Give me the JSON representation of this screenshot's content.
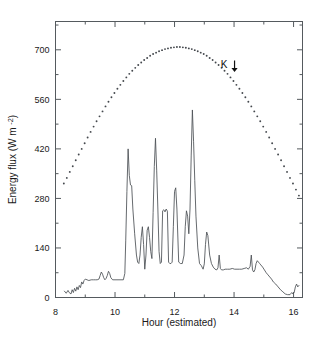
{
  "chart_data": {
    "type": "line",
    "title": "",
    "xlabel": "Hour  (estimated)",
    "ylabel": "Energy flux  (W m⁻²)",
    "xlim": [
      8,
      16.3
    ],
    "ylim": [
      0,
      780
    ],
    "grid": false,
    "legend_position": "none",
    "xticks": [
      8,
      10,
      12,
      14,
      16
    ],
    "xtick_labels": [
      "8",
      "10",
      "12",
      "14",
      "16"
    ],
    "xminor_ticks": [
      9,
      11,
      13,
      15
    ],
    "yticks": [
      0,
      140,
      280,
      420,
      560,
      700
    ],
    "ytick_labels": [
      "0",
      "140",
      "280",
      "420",
      "560",
      "700"
    ],
    "yminor_ticks": [
      70,
      210,
      350,
      490,
      630,
      770
    ],
    "annotations": [
      {
        "name": "k-arrow-annotation",
        "text": "K",
        "x": 14.0,
        "y": 650,
        "marker": "down-arrow"
      }
    ],
    "series": [
      {
        "name": "Clear-sky global solar radiation (K)",
        "style": "dotted",
        "marker": "dot",
        "x": [
          8.28,
          8.38,
          8.48,
          8.58,
          8.68,
          8.78,
          8.88,
          8.98,
          9.08,
          9.18,
          9.28,
          9.38,
          9.48,
          9.58,
          9.68,
          9.78,
          9.88,
          9.98,
          10.08,
          10.18,
          10.28,
          10.38,
          10.48,
          10.58,
          10.68,
          10.78,
          10.88,
          10.98,
          11.08,
          11.18,
          11.28,
          11.38,
          11.48,
          11.58,
          11.68,
          11.78,
          11.88,
          11.98,
          12.08,
          12.18,
          12.28,
          12.38,
          12.48,
          12.58,
          12.68,
          12.78,
          12.88,
          12.98,
          13.08,
          13.18,
          13.28,
          13.38,
          13.48,
          13.58,
          13.68,
          13.78,
          13.88,
          13.98,
          14.08,
          14.18,
          14.28,
          14.38,
          14.48,
          14.58,
          14.68,
          14.78,
          14.88,
          14.98,
          15.08,
          15.18,
          15.28,
          15.38,
          15.48,
          15.58,
          15.68,
          15.78,
          15.88,
          15.98,
          16.08,
          16.18
        ],
        "y": [
          322,
          338,
          355,
          371,
          388,
          404,
          420,
          436,
          452,
          468,
          483,
          498,
          512,
          526,
          540,
          553,
          566,
          578,
          590,
          601,
          612,
          622,
          632,
          641,
          649,
          657,
          664,
          671,
          677,
          683,
          688,
          692,
          696,
          699,
          702,
          704,
          706,
          707,
          708,
          708,
          707,
          706,
          704,
          702,
          699,
          696,
          692,
          688,
          683,
          677,
          671,
          664,
          657,
          649,
          641,
          632,
          622,
          612,
          601,
          590,
          578,
          566,
          553,
          540,
          526,
          512,
          498,
          483,
          468,
          452,
          436,
          420,
          404,
          388,
          371,
          355,
          338,
          322,
          305,
          288
        ]
      },
      {
        "name": "Measured energy flux",
        "style": "solid",
        "marker": "none",
        "x": [
          8.3,
          8.36,
          8.42,
          8.46,
          8.52,
          8.56,
          8.6,
          8.64,
          8.68,
          8.72,
          8.76,
          8.8,
          8.84,
          8.88,
          8.92,
          8.96,
          9.0,
          9.06,
          9.12,
          9.2,
          9.28,
          9.34,
          9.4,
          9.46,
          9.5,
          9.54,
          9.58,
          9.62,
          9.66,
          9.7,
          9.74,
          9.78,
          9.82,
          9.86,
          9.92,
          10.0,
          10.1,
          10.2,
          10.28,
          10.33,
          10.36,
          10.4,
          10.44,
          10.48,
          10.52,
          10.56,
          10.6,
          10.66,
          10.72,
          10.76,
          10.8,
          10.84,
          10.88,
          10.92,
          10.96,
          11.0,
          11.04,
          11.08,
          11.12,
          11.16,
          11.2,
          11.24,
          11.28,
          11.32,
          11.36,
          11.4,
          11.44,
          11.48,
          11.52,
          11.56,
          11.6,
          11.64,
          11.68,
          11.72,
          11.76,
          11.8,
          11.84,
          11.88,
          11.92,
          11.96,
          12.0,
          12.04,
          12.08,
          12.14,
          12.2,
          12.26,
          12.32,
          12.36,
          12.4,
          12.44,
          12.48,
          12.52,
          12.56,
          12.6,
          12.64,
          12.68,
          12.72,
          12.78,
          12.84,
          12.9,
          12.96,
          13.0,
          13.04,
          13.08,
          13.12,
          13.18,
          13.24,
          13.3,
          13.36,
          13.42,
          13.46,
          13.5,
          13.54,
          13.58,
          13.64,
          13.7,
          13.78,
          13.86,
          13.94,
          14.02,
          14.1,
          14.18,
          14.26,
          14.34,
          14.42,
          14.48,
          14.54,
          14.58,
          14.62,
          14.66,
          14.7,
          14.74,
          14.78,
          14.82,
          14.86,
          14.9,
          14.96,
          15.02,
          15.08,
          15.14,
          15.2,
          15.26,
          15.32,
          15.4,
          15.48,
          15.56,
          15.64,
          15.72,
          15.8,
          15.88,
          15.94,
          15.98,
          16.02,
          16.06,
          16.1,
          16.14,
          16.18
        ],
        "y": [
          18,
          12,
          20,
          14,
          10,
          22,
          14,
          26,
          18,
          30,
          22,
          34,
          28,
          44,
          38,
          48,
          52,
          50,
          48,
          50,
          50,
          50,
          50,
          52,
          62,
          72,
          66,
          56,
          50,
          54,
          62,
          74,
          68,
          56,
          50,
          50,
          50,
          50,
          50,
          68,
          160,
          300,
          420,
          345,
          318,
          316,
          250,
          180,
          120,
          100,
          96,
          120,
          170,
          200,
          150,
          80,
          120,
          190,
          200,
          170,
          130,
          110,
          240,
          370,
          450,
          360,
          250,
          130,
          96,
          100,
          245,
          248,
          242,
          250,
          244,
          100,
          96,
          96,
          100,
          200,
          300,
          310,
          250,
          100,
          96,
          96,
          120,
          200,
          245,
          230,
          180,
          250,
          400,
          530,
          440,
          330,
          230,
          140,
          96,
          90,
          80,
          95,
          150,
          185,
          175,
          120,
          96,
          86,
          80,
          78,
          84,
          120,
          82,
          78,
          78,
          80,
          80,
          80,
          82,
          80,
          80,
          80,
          80,
          82,
          84,
          80,
          88,
          120,
          78,
          72,
          78,
          96,
          104,
          100,
          96,
          92,
          86,
          78,
          70,
          64,
          58,
          52,
          44,
          38,
          30,
          22,
          16,
          10,
          8,
          8,
          14,
          10,
          14,
          30,
          38,
          30,
          34
        ]
      }
    ]
  },
  "axis": {
    "x_label": "Hour  (estimated)",
    "y_label_main": "Energy flux",
    "y_label_unit": "(W m",
    "y_label_exp": "-2",
    "y_label_close": ")"
  }
}
